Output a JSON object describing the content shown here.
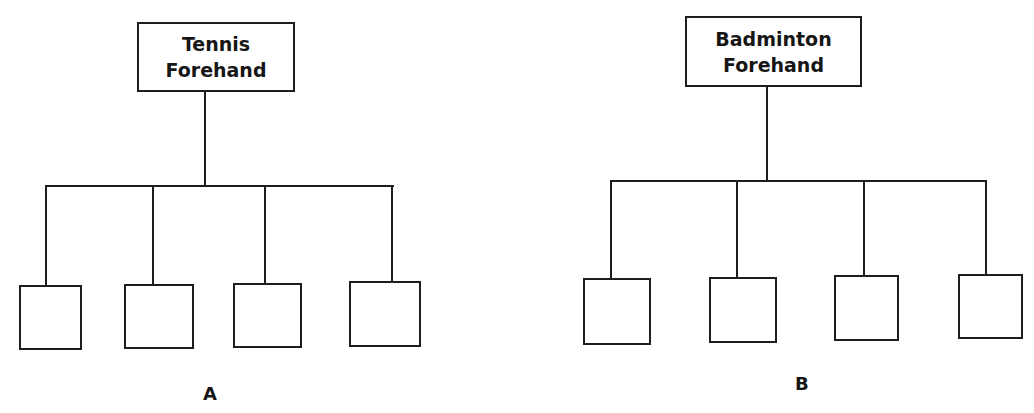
{
  "diagrams": [
    {
      "label": "A",
      "root": {
        "line1": "Tennis",
        "line2": "Forehand"
      },
      "children": [
        "",
        "",
        "",
        ""
      ]
    },
    {
      "label": "B",
      "root": {
        "line1": "Badminton",
        "line2": "Forehand"
      },
      "children": [
        "",
        "",
        "",
        ""
      ]
    }
  ],
  "colors": {
    "line": "#1e1e1e",
    "background": "#ffffff",
    "text": "#161616"
  }
}
